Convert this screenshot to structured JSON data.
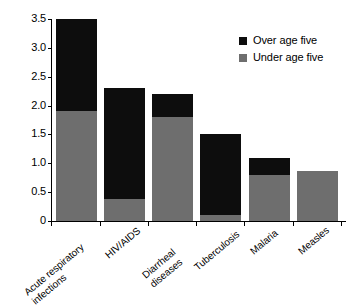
{
  "chart_data": {
    "type": "bar",
    "subtype": "stacked-vertical",
    "title": "",
    "xlabel": "",
    "ylabel": "Deaths in millions",
    "ylim": [
      0,
      3.5
    ],
    "yticks": [
      "0",
      "0.5",
      "1.0",
      "1.5",
      "2.0",
      "2.5",
      "3.0",
      "3.5"
    ],
    "ytick_values": [
      0,
      0.5,
      1.0,
      1.5,
      2.0,
      2.5,
      3.0,
      3.5
    ],
    "grid": false,
    "legend_position": "top-right",
    "categories": [
      "Acute respiratory\ninfections",
      "HIV/AIDS",
      "Diarrheal\ndiseases",
      "Tuberculosis",
      "Malaria",
      "Measles"
    ],
    "series": [
      {
        "name": "Under age five",
        "color": "#6e6e6e",
        "values": [
          1.9,
          0.38,
          1.8,
          0.1,
          0.8,
          0.87
        ]
      },
      {
        "name": "Over age five",
        "color": "#0d0d0d",
        "values": [
          1.6,
          1.92,
          0.4,
          1.4,
          0.3,
          0.0
        ]
      }
    ],
    "totals": [
      3.5,
      2.3,
      2.2,
      1.5,
      1.1,
      0.87
    ]
  },
  "legend": {
    "entries": [
      {
        "label": "Over age five",
        "color": "#0d0d0d"
      },
      {
        "label": "Under age five",
        "color": "#6e6e6e"
      }
    ]
  }
}
